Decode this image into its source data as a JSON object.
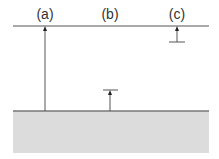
{
  "diagram": {
    "labels": [
      {
        "id": "a",
        "text": "(a)",
        "x": 45
      },
      {
        "id": "b",
        "text": "(b)",
        "x": 110
      },
      {
        "id": "c",
        "text": "(c)",
        "x": 177
      }
    ],
    "colors": {
      "line": "#555555",
      "ground_fill": "#dcdcdc",
      "ground_edge": "#777777",
      "label": "#333333"
    }
  }
}
